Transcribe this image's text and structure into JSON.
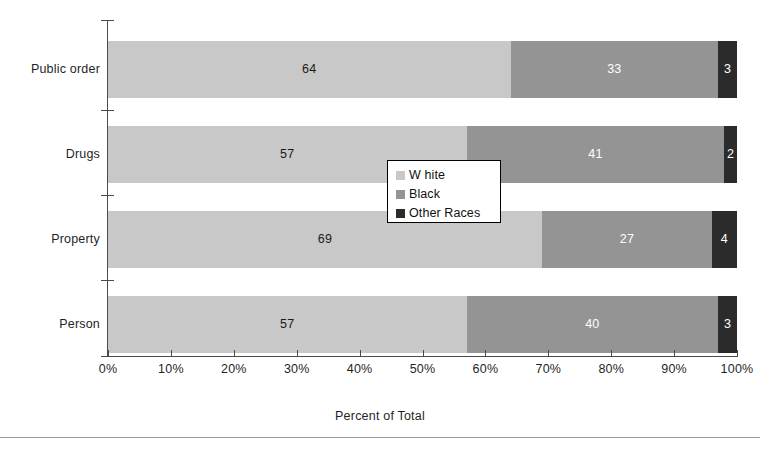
{
  "chart_data": {
    "type": "bar",
    "subtype": "stacked-horizontal-100pct",
    "title": "",
    "xlabel": "Percent of Total",
    "ylabel": "",
    "xlim": [
      0,
      100
    ],
    "grid": false,
    "legend_position": "inside-center",
    "categories": [
      "Public order",
      "Drugs",
      "Property",
      "Person"
    ],
    "category_order_top_to_bottom": [
      "Public order",
      "Drugs",
      "Property",
      "Person"
    ],
    "xticks": [
      "0%",
      "10%",
      "20%",
      "30%",
      "40%",
      "50%",
      "60%",
      "70%",
      "80%",
      "90%",
      "100%"
    ],
    "xtick_values": [
      0,
      10,
      20,
      30,
      40,
      50,
      60,
      70,
      80,
      90,
      100
    ],
    "series": [
      {
        "name": "W hite",
        "color": "#c8c8c8",
        "values": [
          64,
          57,
          69,
          57
        ]
      },
      {
        "name": "Black",
        "color": "#949494",
        "values": [
          33,
          41,
          27,
          40
        ]
      },
      {
        "name": "Other Races",
        "color": "#2b2b2b",
        "values": [
          3,
          2,
          4,
          3
        ]
      }
    ],
    "bars": [
      {
        "category": "Public order",
        "segments": [
          {
            "series": "W hite",
            "value": 64,
            "label": "64",
            "start": 0,
            "end": 64
          },
          {
            "series": "Black",
            "value": 33,
            "label": "33",
            "start": 64,
            "end": 97
          },
          {
            "series": "Other Races",
            "value": 3,
            "label": "3",
            "start": 97,
            "end": 100
          }
        ]
      },
      {
        "category": "Drugs",
        "segments": [
          {
            "series": "W hite",
            "value": 57,
            "label": "57",
            "start": 0,
            "end": 57
          },
          {
            "series": "Black",
            "value": 41,
            "label": "41",
            "start": 57,
            "end": 98
          },
          {
            "series": "Other Races",
            "value": 2,
            "label": "2",
            "start": 98,
            "end": 100
          }
        ]
      },
      {
        "category": "Property",
        "segments": [
          {
            "series": "W hite",
            "value": 69,
            "label": "69",
            "start": 0,
            "end": 69
          },
          {
            "series": "Black",
            "value": 27,
            "label": "27",
            "start": 69,
            "end": 96
          },
          {
            "series": "Other Races",
            "value": 4,
            "label": "4",
            "start": 96,
            "end": 100
          }
        ]
      },
      {
        "category": "Person",
        "segments": [
          {
            "series": "W hite",
            "value": 57,
            "label": "57",
            "start": 0,
            "end": 57
          },
          {
            "series": "Black",
            "value": 40,
            "label": "40",
            "start": 57,
            "end": 97
          },
          {
            "series": "Other Races",
            "value": 3,
            "label": "3",
            "start": 97,
            "end": 100
          }
        ]
      }
    ]
  },
  "legend": {
    "items": [
      {
        "label": "W hite",
        "color": "#c8c8c8"
      },
      {
        "label": "Black",
        "color": "#949494"
      },
      {
        "label": "Other Races",
        "color": "#2b2b2b"
      }
    ]
  },
  "axis": {
    "x_title": "Percent of Total"
  }
}
